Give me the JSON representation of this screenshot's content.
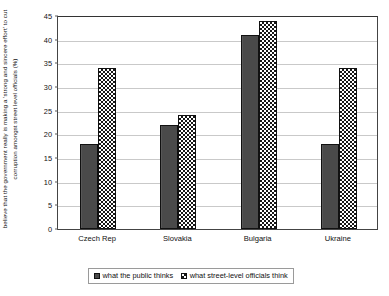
{
  "chart_data": {
    "type": "bar",
    "title": "",
    "xlabel": "",
    "ylabel": "believe that the government really is making a 'strong and sincere effort' to cut corruption amongst street level officials (%)",
    "categories": [
      "Czech Rep",
      "Slovakia",
      "Bulgaria",
      "Ukraine"
    ],
    "series": [
      {
        "name": "what the public thinks",
        "values": [
          18,
          22,
          41,
          18
        ],
        "fill": "solid",
        "color": "#4a4a4a"
      },
      {
        "name": "what street-level officials think",
        "values": [
          34,
          24,
          44,
          34
        ],
        "fill": "dots",
        "color": "#161616"
      }
    ],
    "ylim": [
      0,
      45
    ],
    "ytick_step": 5,
    "yticks": [
      "0",
      "5",
      "10",
      "15",
      "20",
      "25",
      "30",
      "35",
      "40",
      "45"
    ],
    "grid": true,
    "legend_position": "bottom"
  },
  "legend": {
    "items": [
      {
        "label": "what the public thinks"
      },
      {
        "label": "what street-level officials think"
      }
    ]
  }
}
